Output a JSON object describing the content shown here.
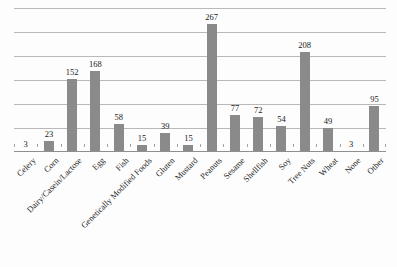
{
  "chart_data": {
    "type": "bar",
    "title": "",
    "xlabel": "",
    "ylabel": "",
    "ylim": [
      0,
      300
    ],
    "grid": true,
    "gridline_step": 50,
    "legend": "none",
    "orientation": "vertical",
    "bar_color": "#8a8a8a",
    "categories": [
      "Celery",
      "Corn",
      "Dairy/Casein/Lactose",
      "Egg",
      "Fish",
      "Genetically Modified Foods",
      "Gluten",
      "Mustard",
      "Peanuts",
      "Sesame",
      "Shellfish",
      "Soy",
      "Tree Nuts",
      "Wheat",
      "None",
      "Other"
    ],
    "values": [
      3,
      23,
      152,
      168,
      58,
      15,
      39,
      15,
      267,
      77,
      72,
      54,
      208,
      49,
      3,
      95
    ],
    "data_labels": [
      "3",
      "23",
      "152",
      "168",
      "58",
      "15",
      "39",
      "15",
      "267",
      "77",
      "72",
      "54",
      "208",
      "49",
      "3",
      "95"
    ]
  },
  "colors": {
    "bar": "#8a8a8a",
    "gridline": "#b9b9b9",
    "axis": "#8f8f8f",
    "text": "#1a1a1a",
    "background": "#fdfdfd"
  }
}
